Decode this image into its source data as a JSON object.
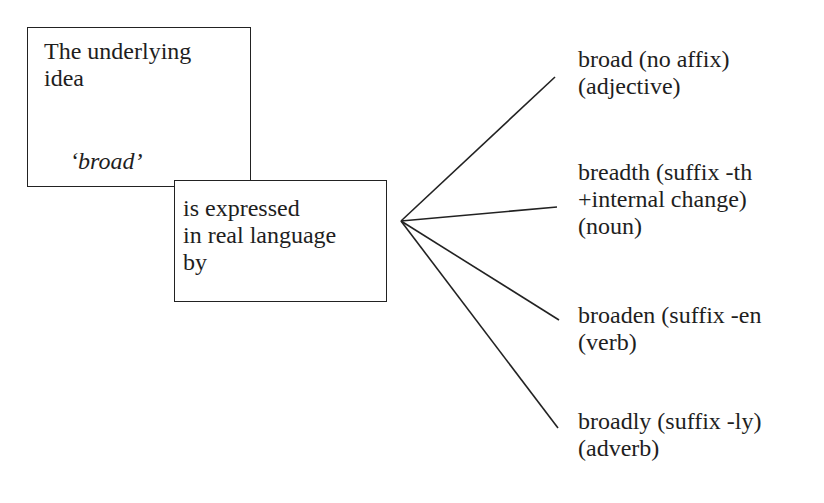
{
  "diagram": {
    "idea_box": {
      "lines": [
        "The underlying",
        "idea"
      ],
      "word": "‘broad’"
    },
    "expression_box": {
      "lines": [
        "is expressed",
        "in real language",
        "by"
      ]
    },
    "forms": [
      {
        "lines": [
          "broad (no affix)",
          "(adjective)"
        ]
      },
      {
        "lines": [
          "breadth (suffix -th",
          "+internal change)",
          "(noun)"
        ]
      },
      {
        "lines": [
          "broaden (suffix -en",
          "(verb)"
        ]
      },
      {
        "lines": [
          "broadly (suffix -ly)",
          "(adverb)"
        ]
      }
    ],
    "line_color": "#222222"
  }
}
